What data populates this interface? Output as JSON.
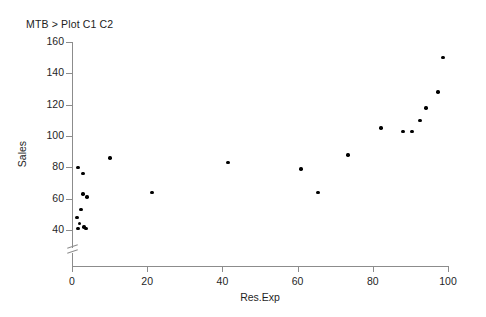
{
  "session": {
    "command": "MTB > Plot C1 C2"
  },
  "chart_data": {
    "type": "scatter",
    "title": "",
    "xlabel": "Res.Exp",
    "ylabel": "Sales",
    "xlim": [
      0,
      100
    ],
    "ylim": [
      35,
      160
    ],
    "xticks": [
      0,
      20,
      40,
      60,
      80,
      100
    ],
    "yticks": [
      40,
      60,
      80,
      100,
      120,
      140,
      160
    ],
    "grid": false,
    "legend": null,
    "y_axis_break": true,
    "marker": "filled-circle",
    "marker_color": "#000000",
    "points": [
      {
        "x": 1.6,
        "y": 41
      },
      {
        "x": 2.0,
        "y": 44
      },
      {
        "x": 1.3,
        "y": 48
      },
      {
        "x": 2.4,
        "y": 53
      },
      {
        "x": 3.2,
        "y": 42
      },
      {
        "x": 3.7,
        "y": 41
      },
      {
        "x": 2.9,
        "y": 63
      },
      {
        "x": 4.0,
        "y": 61
      },
      {
        "x": 1.6,
        "y": 80
      },
      {
        "x": 2.9,
        "y": 76
      },
      {
        "x": 10.1,
        "y": 86
      },
      {
        "x": 21.3,
        "y": 64
      },
      {
        "x": 41.5,
        "y": 83
      },
      {
        "x": 60.9,
        "y": 79
      },
      {
        "x": 65.4,
        "y": 64
      },
      {
        "x": 73.4,
        "y": 88
      },
      {
        "x": 82.2,
        "y": 105
      },
      {
        "x": 88.0,
        "y": 103
      },
      {
        "x": 90.4,
        "y": 103
      },
      {
        "x": 92.6,
        "y": 110
      },
      {
        "x": 94.1,
        "y": 118
      },
      {
        "x": 97.3,
        "y": 128
      },
      {
        "x": 98.7,
        "y": 150
      }
    ]
  }
}
